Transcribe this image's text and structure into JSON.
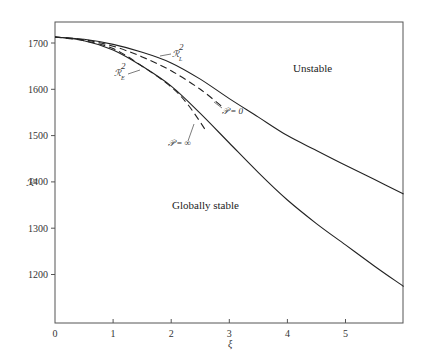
{
  "chart_data": {
    "type": "line",
    "title": "",
    "xlabel": "ξ",
    "ylabel": "ℛ²",
    "xlim": [
      0,
      6
    ],
    "ylim": [
      1100,
      1745
    ],
    "x_ticks": [
      0,
      1,
      2,
      3,
      4,
      5
    ],
    "y_ticks": [
      1200,
      1300,
      1400,
      1500,
      1600,
      1700
    ],
    "grid": false,
    "legend": "none (curves labelled inline)",
    "series": [
      {
        "name": "ℛ²_L",
        "style": "solid",
        "x": [
          0,
          0.5,
          1,
          1.5,
          2,
          2.5,
          3,
          3.5,
          4,
          4.5,
          5,
          5.5,
          6
        ],
        "values": [
          1713,
          1708,
          1697,
          1680,
          1657,
          1622,
          1580,
          1540,
          1500,
          1468,
          1436,
          1405,
          1374
        ]
      },
      {
        "name": "ℛ²_E",
        "style": "solid",
        "x": [
          0,
          0.5,
          1,
          1.5,
          2,
          2.5,
          3,
          3.5,
          4,
          4.5,
          5,
          5.5,
          6
        ],
        "values": [
          1713,
          1705,
          1685,
          1650,
          1607,
          1548,
          1484,
          1420,
          1361,
          1310,
          1264,
          1218,
          1174
        ]
      },
      {
        "name": "𝒫 = 0",
        "style": "dashed",
        "x": [
          0,
          0.5,
          1,
          1.5,
          2,
          2.5,
          2.9
        ],
        "values": [
          1713,
          1707,
          1693,
          1670,
          1640,
          1600,
          1560
        ]
      },
      {
        "name": "𝒫 = ∞",
        "style": "dashed",
        "x": [
          0,
          0.5,
          1,
          1.5,
          2,
          2.3,
          2.6
        ],
        "values": [
          1713,
          1705,
          1688,
          1650,
          1605,
          1565,
          1510
        ]
      }
    ],
    "annotations": [
      {
        "text": "Unstable",
        "x": 4.3,
        "y": 1660
      },
      {
        "text": "Globally stable",
        "x": 2.6,
        "y": 1355
      }
    ]
  },
  "labels": {
    "y_axis": "ℛ²",
    "x_axis": "ξ",
    "unstable": "Unstable",
    "globally_stable": "Globally stable",
    "curve_L_main": "ℛ",
    "curve_L_sub": "L",
    "curve_E_main": "ℛ",
    "curve_E_sub": "E",
    "p_zero": "𝒫 = 0",
    "p_inf": "𝒫 = ∞",
    "sup2": "2"
  },
  "ticks": {
    "x": [
      "0",
      "1",
      "2",
      "3",
      "4",
      "5"
    ],
    "y": [
      "1700",
      "1600",
      "1500",
      "1400",
      "1300",
      "1200"
    ]
  }
}
